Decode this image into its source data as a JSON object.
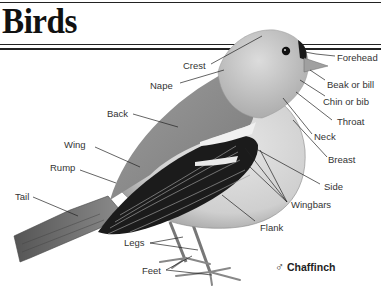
{
  "page": {
    "title": "Birds",
    "caption": {
      "symbol": "♂",
      "text": "Chaffinch"
    }
  },
  "labels": {
    "crest": "Crest",
    "forehead": "Forehead",
    "nape": "Nape",
    "beak": "Beak or bill",
    "chin": "Chin or bib",
    "throat": "Throat",
    "back": "Back",
    "neck": "Neck",
    "breast": "Breast",
    "wing": "Wing",
    "side": "Side",
    "rump": "Rump",
    "wingbars": "Wingbars",
    "tail": "Tail",
    "flank": "Flank",
    "legs": "Legs",
    "feet": "Feet"
  },
  "colors": {
    "ink": "#111111",
    "label": "#333333",
    "bird_head": "#c8c8c8",
    "bird_back": "#8a8a8a",
    "bird_breast": "#d8d8d8",
    "wing_dark": "#1a1a1a",
    "wingbar": "#f2f2f2"
  }
}
